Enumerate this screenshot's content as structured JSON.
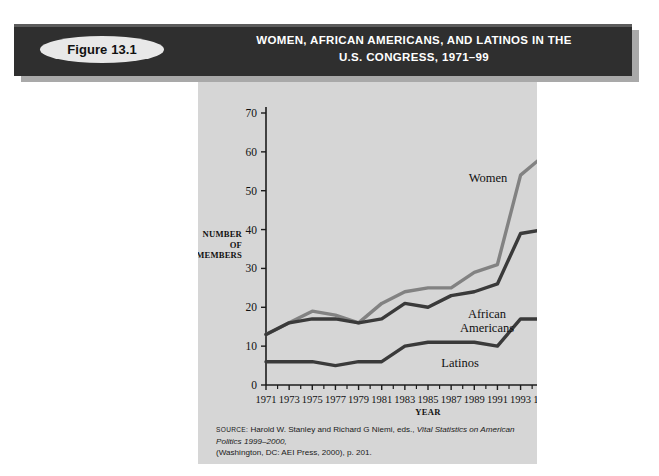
{
  "figure": {
    "badge_label": "Figure 13.1",
    "title_line1": "WOMEN, AFRICAN AMERICANS, AND LATINOS IN THE",
    "title_line2": "U.S. CONGRESS, 1971–99"
  },
  "source": {
    "prefix": "SOURCE:",
    "text_part1": "Harold W. Stanley and Richard G Niemi, eds.,",
    "italic_part": "Vital Statistics on American Politics 1999–2000,",
    "text_part2": "(Washington, DC: AEI Press, 2000), p. 201."
  },
  "colors": {
    "panel_background": "#d6d6d6",
    "banner_background": "#2f2f2f",
    "banner_text": "#ffffff",
    "badge_background": "#e8e8e8",
    "women_line": "#828282",
    "african_americans_line": "#3a3a3a",
    "latinos_line": "#3a3a3a",
    "axis": "#1c1c1c"
  },
  "chart_data": {
    "type": "line",
    "title": "WOMEN, AFRICAN AMERICANS, AND LATINOS IN THE U.S. CONGRESS, 1971–99",
    "xlabel": "YEAR",
    "ylabel": "NUMBER OF MEMBERS",
    "ylabel_lines": [
      "NUMBER",
      "OF",
      "MEMBERS"
    ],
    "grid": false,
    "legend_position": "inline-annotations",
    "xlim": [
      1971,
      1999
    ],
    "ylim": [
      0,
      70
    ],
    "yticks": [
      0,
      10,
      20,
      30,
      40,
      50,
      60,
      70
    ],
    "ytick_labels": [
      "0",
      "10",
      "20",
      "30",
      "40",
      "50",
      "60",
      "70"
    ],
    "x": [
      1971,
      1973,
      1975,
      1977,
      1979,
      1981,
      1983,
      1985,
      1987,
      1989,
      1991,
      1993,
      1995,
      1997,
      1999
    ],
    "xtick_labels": [
      "1971",
      "1973",
      "1975",
      "1977",
      "1979",
      "1981",
      "1983",
      "1985",
      "1987",
      "1989",
      "1991",
      "1993",
      "1995",
      "1997",
      "1999"
    ],
    "series": [
      {
        "name": "Women",
        "color": "#828282",
        "annotation": "Women",
        "values": [
          13,
          16,
          19,
          18,
          16,
          21,
          24,
          25,
          25,
          29,
          31,
          54,
          59,
          61,
          67
        ]
      },
      {
        "name": "African Americans",
        "color": "#3a3a3a",
        "annotation": "African Americans",
        "annotation_lines": [
          "African",
          "Americans"
        ],
        "values": [
          13,
          16,
          17,
          17,
          16,
          17,
          21,
          20,
          23,
          24,
          26,
          39,
          40,
          39,
          39
        ]
      },
      {
        "name": "Latinos",
        "color": "#3a3a3a",
        "annotation": "Latinos",
        "values": [
          6,
          6,
          6,
          5,
          6,
          6,
          10,
          11,
          11,
          11,
          10,
          17,
          17,
          19,
          19
        ]
      }
    ]
  }
}
